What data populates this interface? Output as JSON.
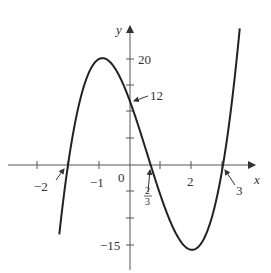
{
  "chart_data": {
    "type": "line",
    "title": "",
    "function": "y = (x + 2)(3x - 2)(x - 3)",
    "xlabel": "x",
    "ylabel": "y",
    "xlim": [
      -3.2,
      4.6
    ],
    "ylim": [
      -20,
      26
    ],
    "grid": false,
    "x_tick_labels": [
      "-2",
      "-1",
      "0",
      "2/3",
      "2",
      "3"
    ],
    "y_tick_labels": [
      "20",
      "12",
      "-15"
    ],
    "key_points": [
      {
        "x": -2,
        "y": 0,
        "label": "-2",
        "note": "x-intercept"
      },
      {
        "x": -1,
        "y": 20,
        "label": "20",
        "note": "local maximum"
      },
      {
        "x": 0,
        "y": 12,
        "label": "12",
        "note": "y-intercept"
      },
      {
        "x": 0.6667,
        "y": 0,
        "label": "2/3",
        "note": "x-intercept"
      },
      {
        "x": 2,
        "y": -16,
        "label": "-15",
        "note": "local minimum (tick near -15)"
      },
      {
        "x": 3,
        "y": 0,
        "label": "3",
        "note": "x-intercept"
      }
    ],
    "series": [
      {
        "name": "f(x)",
        "x": [
          -2.25,
          -2,
          -1.5,
          -1,
          -0.5,
          0,
          0.5,
          0.6667,
          1,
          1.5,
          2,
          2.5,
          3,
          3.3,
          3.6
        ],
        "values": [
          -16.1,
          0,
          15.75,
          20,
          17.25,
          12,
          4.5,
          0,
          -6,
          -12.75,
          -16,
          -12.25,
          0,
          11.2,
          29.6
        ]
      }
    ]
  },
  "axes": {
    "x_axis_label": "x",
    "y_axis_label": "y"
  },
  "annotations": {
    "root_left": "−2",
    "root_mid_num": "2",
    "root_mid_den": "3",
    "root_right": "3",
    "y_intercept": "12",
    "max_value": "20",
    "min_value": "−15",
    "tick_neg1": "−1",
    "tick_zero": "0",
    "tick_two": "2"
  }
}
